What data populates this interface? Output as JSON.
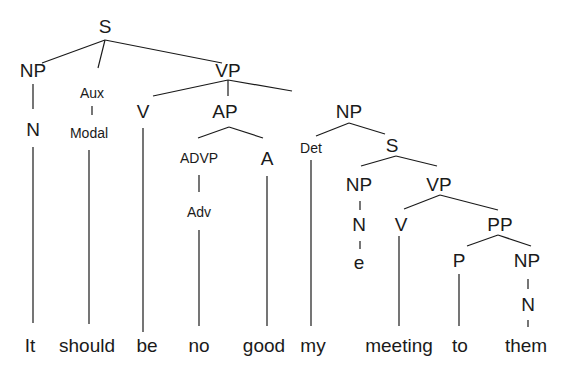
{
  "diagram": {
    "type": "syntax-tree",
    "sentence": "It should be no good my meeting to them",
    "edge_color": "#1a1a1a",
    "nodes": [
      {
        "id": "S",
        "label": "S",
        "x": 105,
        "y": 26,
        "size": "big"
      },
      {
        "id": "NP1",
        "label": "NP",
        "x": 33,
        "y": 70,
        "size": "big"
      },
      {
        "id": "Aux",
        "label": "Aux",
        "x": 92,
        "y": 93,
        "size": "small"
      },
      {
        "id": "VP1",
        "label": "VP",
        "x": 228,
        "y": 70,
        "size": "big"
      },
      {
        "id": "N1",
        "label": "N",
        "x": 33,
        "y": 129,
        "size": "big"
      },
      {
        "id": "Modal",
        "label": "Modal",
        "x": 89,
        "y": 133,
        "size": "small"
      },
      {
        "id": "V1",
        "label": "V",
        "x": 143,
        "y": 111,
        "size": "big"
      },
      {
        "id": "AP",
        "label": "AP",
        "x": 225,
        "y": 111,
        "size": "big"
      },
      {
        "id": "NP2",
        "label": "NP",
        "x": 349,
        "y": 111,
        "size": "big"
      },
      {
        "id": "ADVP",
        "label": "ADVP",
        "x": 199,
        "y": 158,
        "size": "small"
      },
      {
        "id": "A",
        "label": "A",
        "x": 267,
        "y": 158,
        "size": "big"
      },
      {
        "id": "Det",
        "label": "Det",
        "x": 311,
        "y": 148,
        "size": "small"
      },
      {
        "id": "S2",
        "label": "S",
        "x": 392,
        "y": 145,
        "size": "big"
      },
      {
        "id": "Adv",
        "label": "Adv",
        "x": 199,
        "y": 212,
        "size": "small"
      },
      {
        "id": "NP3",
        "label": "NP",
        "x": 359,
        "y": 184,
        "size": "big"
      },
      {
        "id": "VP2",
        "label": "VP",
        "x": 439,
        "y": 184,
        "size": "big"
      },
      {
        "id": "N2",
        "label": "N",
        "x": 359,
        "y": 224,
        "size": "big"
      },
      {
        "id": "V2",
        "label": "V",
        "x": 401,
        "y": 224,
        "size": "big"
      },
      {
        "id": "PP",
        "label": "PP",
        "x": 500,
        "y": 224,
        "size": "big"
      },
      {
        "id": "e",
        "label": "e",
        "x": 359,
        "y": 262,
        "size": "big"
      },
      {
        "id": "P",
        "label": "P",
        "x": 459,
        "y": 260,
        "size": "big"
      },
      {
        "id": "NP4",
        "label": "NP",
        "x": 527,
        "y": 260,
        "size": "big"
      },
      {
        "id": "N3",
        "label": "N",
        "x": 528,
        "y": 304,
        "size": "big"
      }
    ],
    "edges": [
      [
        105,
        40,
        42,
        63
      ],
      [
        105,
        40,
        98,
        68
      ],
      [
        105,
        40,
        222,
        63
      ],
      [
        33,
        84,
        33,
        109
      ],
      [
        92,
        106,
        92,
        115
      ],
      [
        228,
        80,
        153,
        96
      ],
      [
        228,
        80,
        228,
        96
      ],
      [
        228,
        80,
        292,
        91
      ],
      [
        33,
        147,
        33,
        323
      ],
      [
        89,
        150,
        89,
        324
      ],
      [
        143,
        128,
        143,
        332
      ],
      [
        229,
        127,
        198,
        138
      ],
      [
        229,
        127,
        263,
        138
      ],
      [
        349,
        123,
        316,
        136
      ],
      [
        349,
        123,
        385,
        134
      ],
      [
        199,
        175,
        199,
        192
      ],
      [
        267,
        176,
        267,
        326
      ],
      [
        311,
        160,
        311,
        326
      ],
      [
        396,
        156,
        361,
        166
      ],
      [
        396,
        156,
        437,
        166
      ],
      [
        199,
        230,
        199,
        326
      ],
      [
        360,
        201,
        360,
        210
      ],
      [
        360,
        241,
        360,
        249
      ],
      [
        440,
        195,
        404,
        209
      ],
      [
        440,
        195,
        498,
        210
      ],
      [
        399,
        236,
        399,
        326
      ],
      [
        498,
        235,
        467,
        246
      ],
      [
        498,
        235,
        531,
        246
      ],
      [
        459,
        274,
        459,
        326
      ],
      [
        528,
        279,
        528,
        289
      ],
      [
        528,
        320,
        528,
        327
      ]
    ],
    "words": [
      {
        "text": "It",
        "x": 30
      },
      {
        "text": "should",
        "x": 87
      },
      {
        "text": "be",
        "x": 147
      },
      {
        "text": "no",
        "x": 199
      },
      {
        "text": "good",
        "x": 264
      },
      {
        "text": "my",
        "x": 313
      },
      {
        "text": "meeting",
        "x": 399
      },
      {
        "text": "to",
        "x": 460
      },
      {
        "text": "them",
        "x": 526
      }
    ],
    "words_y": 345
  }
}
